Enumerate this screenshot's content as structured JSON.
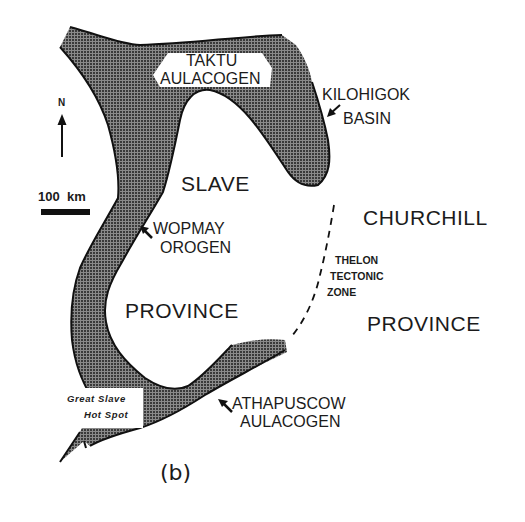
{
  "figure": {
    "panel_label": "(b)",
    "colors": {
      "shading": "#5a5a5a",
      "outline": "#111111",
      "background": "#ffffff"
    }
  },
  "legend": {
    "north_label": "N",
    "north_icon": "north-arrow",
    "scale_label": "100  km",
    "scale_icon": "scale-bar"
  },
  "regions": {
    "slave_province": {
      "line1": "SLAVE",
      "line2": "PROVINCE"
    },
    "churchill_province": {
      "line1": "CHURCHILL",
      "line2": "PROVINCE"
    }
  },
  "features": {
    "taktu": {
      "line1": "TAKTU",
      "line2": "AULACOGEN"
    },
    "kilohigok": {
      "line1": "KILOHIGOK",
      "line2": "BASIN"
    },
    "wopmay": {
      "line1": "WOPMAY",
      "line2": "OROGEN"
    },
    "thelon": {
      "line1": "THELON",
      "line2": "TECTONIC",
      "line3": "ZONE"
    },
    "athapuscow": {
      "line1": "ATHAPUSCOW",
      "line2": "AULACOGEN"
    },
    "great_slave": {
      "line1": "Great Slave",
      "line2": "Hot Spot"
    }
  }
}
